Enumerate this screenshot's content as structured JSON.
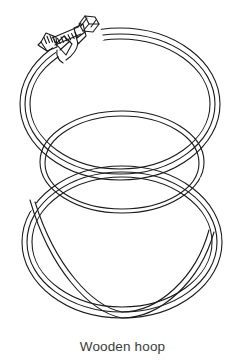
{
  "figure": {
    "caption": "Wooden hoop",
    "background_color": "#ffffff",
    "line_color": "#1a1a1a",
    "caption_color": "#3b3b3b",
    "width": 245,
    "height": 364,
    "style": "black-and-white line drawing"
  },
  "subject": {
    "name": "wooden embroidery hoop",
    "alt_text": "Line drawing of a wooden embroidery hoop: an outer ring with a metal tension screw at the top left and an inner ring nested inside, shown in perspective.",
    "parts": [
      {
        "id": "outer-ring",
        "label": "Outer ring",
        "description": "Large outer hoop band drawn as two concentric perspective ellipses"
      },
      {
        "id": "inner-ring",
        "label": "Inner ring",
        "description": "Inner hoop band nested inside and offset downward, drawn as two concentric perspective ellipses"
      },
      {
        "id": "tension-screw",
        "label": "Tension screw",
        "description": "Threaded metal bolt with hex nut and knurled thumb nut joining the two bracket tabs of the outer ring"
      },
      {
        "id": "bracket-tabs",
        "label": "Bracket tabs",
        "description": "Pair of flat metal tabs at the split of the outer ring that the screw passes through"
      }
    ]
  }
}
